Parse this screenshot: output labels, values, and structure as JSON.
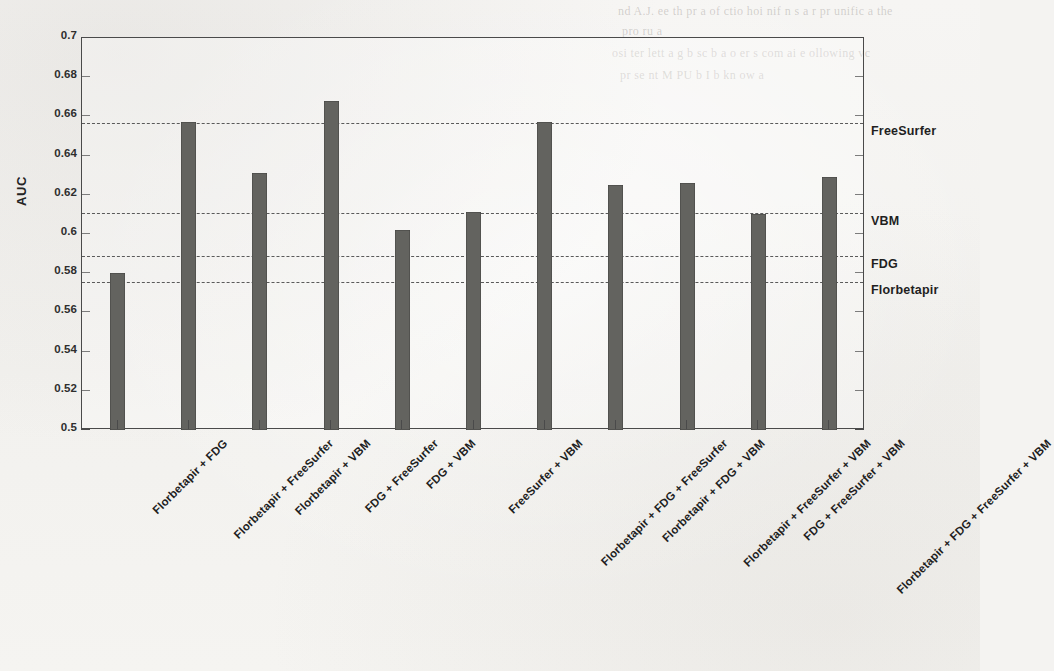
{
  "chart_data": {
    "type": "bar",
    "title": "",
    "xlabel": "",
    "ylabel": "AUC",
    "ylim": [
      0.5,
      0.7
    ],
    "yticks": [
      0.5,
      0.52,
      0.54,
      0.56,
      0.58,
      0.6,
      0.62,
      0.64,
      0.66,
      0.68,
      0.7
    ],
    "ytick_labels": [
      "0.5",
      "0.52",
      "0.54",
      "0.56",
      "0.58",
      "0.6",
      "0.62",
      "0.64",
      "0.66",
      "0.68",
      "0.7"
    ],
    "grid": false,
    "legend": "none",
    "bar_color": "#63635f",
    "categories": [
      "Florbetapir + FDG",
      "Florbetapir + FreeSurfer",
      "Florbetapir + VBM",
      "FDG + FreeSurfer",
      "FDG + VBM",
      "FreeSurfer + VBM",
      "Florbetapir + FDG + FreeSurfer",
      "Florbetapir + FDG + VBM",
      "Florbetapir + FreeSurfer + VBM",
      "FDG + FreeSurfer + VBM",
      "Florbetapir + FDG + FreeSurfer + VBM"
    ],
    "values": [
      0.58,
      0.657,
      0.631,
      0.668,
      0.602,
      0.611,
      0.657,
      0.625,
      0.626,
      0.61,
      0.629
    ],
    "reference_lines": [
      {
        "label": "FreeSurfer",
        "value": 0.6565,
        "style": "dashed"
      },
      {
        "label": "VBM",
        "value": 0.6105,
        "style": "dashed"
      },
      {
        "label": "FDG",
        "value": 0.589,
        "style": "dashed"
      },
      {
        "label": "Florbetapir",
        "value": 0.5755,
        "style": "dashed"
      }
    ]
  },
  "page": {
    "bleed_lines": [
      "nd A.J.  ee  th  pr a  of  ctio  hoi  nif  n  s  a  r  pr  unific  a  the",
      "pro  ru  a",
      "osi  ter  lett  a  g  b  sc  b  a  o  er  s  com  ai  e  ollowing vc",
      "pr  se  nt  M  PU  b  I  b  kn  ow  a"
    ]
  }
}
